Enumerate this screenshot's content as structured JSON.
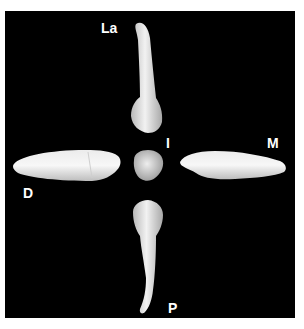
{
  "figure": {
    "background_color": "#000000",
    "labels": {
      "labial": "La",
      "incisal": "I",
      "mesial": "M",
      "distal": "D",
      "palatal": "P"
    }
  }
}
